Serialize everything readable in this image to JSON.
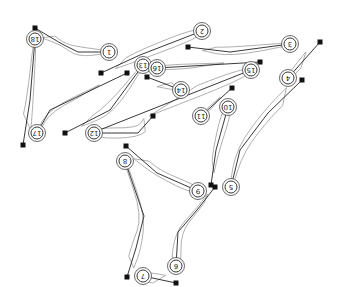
{
  "diagram": {
    "type": "golf-course-layout",
    "orientation": "rotated-180",
    "colors": {
      "line": "#222222",
      "rough": "#9a9a9a",
      "tee": "#111111",
      "background": "#ffffff"
    },
    "holes": [
      {
        "number": "1",
        "green": [
          109,
          52
        ],
        "tee": [
          35,
          28
        ],
        "path": [
          [
            35,
            28
          ],
          [
            62,
            44
          ],
          [
            78,
            52
          ],
          [
            109,
            52
          ]
        ]
      },
      {
        "number": "2",
        "green": [
          202,
          31
        ],
        "tee": [
          101,
          73
        ],
        "path": [
          [
            101,
            73
          ],
          [
            140,
            55
          ],
          [
            202,
            31
          ]
        ]
      },
      {
        "number": "3",
        "green": [
          290,
          44
        ],
        "tee": [
          188,
          47
        ],
        "path": [
          [
            188,
            47
          ],
          [
            230,
            52
          ],
          [
            290,
            44
          ]
        ]
      },
      {
        "number": "4",
        "green": [
          288,
          78
        ],
        "tee": [
          320,
          42
        ],
        "path": [
          [
            320,
            42
          ],
          [
            288,
            78
          ]
        ]
      },
      {
        "number": "5",
        "green": [
          231,
          187
        ],
        "tee": [
          302,
          80
        ],
        "path": [
          [
            302,
            80
          ],
          [
            268,
            113
          ],
          [
            240,
            150
          ],
          [
            231,
            187
          ]
        ]
      },
      {
        "number": "6",
        "green": [
          176,
          266
        ],
        "tee": [
          215,
          187
        ],
        "path": [
          [
            215,
            187
          ],
          [
            197,
            210
          ],
          [
            178,
            232
          ],
          [
            176,
            266
          ]
        ]
      },
      {
        "number": "7",
        "green": [
          143,
          276
        ],
        "tee": [
          176,
          283
        ],
        "path": [
          [
            176,
            283
          ],
          [
            143,
            276
          ]
        ]
      },
      {
        "number": "8",
        "green": [
          125,
          161
        ],
        "tee": [
          127,
          277
        ],
        "path": [
          [
            127,
            277
          ],
          [
            136,
            248
          ],
          [
            144,
            216
          ],
          [
            125,
            161
          ]
        ]
      },
      {
        "number": "9",
        "green": [
          198,
          191
        ],
        "tee": [
          126,
          146
        ],
        "path": [
          [
            126,
            146
          ],
          [
            157,
            173
          ],
          [
            198,
            191
          ]
        ]
      },
      {
        "number": "10",
        "green": [
          228,
          107
        ],
        "tee": [
          211,
          185
        ],
        "path": [
          [
            211,
            185
          ],
          [
            216,
            150
          ],
          [
            228,
            107
          ]
        ]
      },
      {
        "number": "11",
        "green": [
          201,
          116
        ],
        "tee": [
          232,
          88
        ],
        "path": [
          [
            232,
            88
          ],
          [
            201,
            116
          ]
        ]
      },
      {
        "number": "12",
        "green": [
          94,
          133
        ],
        "tee": [
          153,
          116
        ],
        "path": [
          [
            153,
            116
          ],
          [
            138,
            133
          ],
          [
            94,
            133
          ]
        ]
      },
      {
        "number": "13",
        "green": [
          143,
          65
        ],
        "tee": [
          65,
          133
        ],
        "path": [
          [
            65,
            133
          ],
          [
            110,
            110
          ],
          [
            143,
            65
          ]
        ]
      },
      {
        "number": "14",
        "green": [
          181,
          90
        ],
        "tee": [
          147,
          77
        ],
        "path": [
          [
            147,
            77
          ],
          [
            181,
            90
          ]
        ]
      },
      {
        "number": "15",
        "green": [
          251,
          70
        ],
        "tee": [
          92,
          133
        ],
        "path": [
          [
            92,
            133
          ],
          [
            251,
            70
          ]
        ]
      },
      {
        "number": "16",
        "green": [
          157,
          68
        ],
        "tee": [
          260,
          62
        ],
        "path": [
          [
            260,
            62
          ],
          [
            157,
            68
          ]
        ]
      },
      {
        "number": "17",
        "green": [
          37,
          133
        ],
        "tee": [
          127,
          73
        ],
        "path": [
          [
            127,
            73
          ],
          [
            50,
            110
          ],
          [
            37,
            133
          ]
        ]
      },
      {
        "number": "18",
        "green": [
          35,
          39
        ],
        "tee": [
          23,
          145
        ],
        "path": [
          [
            23,
            145
          ],
          [
            30,
            100
          ],
          [
            35,
            39
          ]
        ]
      }
    ]
  }
}
